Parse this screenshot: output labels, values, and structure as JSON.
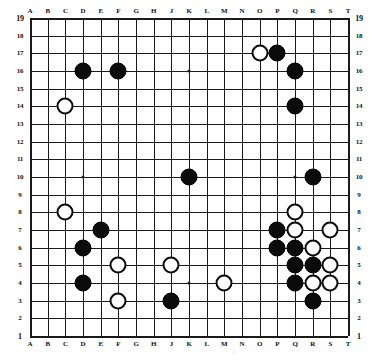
{
  "board": {
    "title": "Go board position",
    "size": 19,
    "col_labels": [
      "A",
      "B",
      "C",
      "D",
      "E",
      "F",
      "G",
      "H",
      "J",
      "K",
      "L",
      "M",
      "N",
      "O",
      "P",
      "Q",
      "R",
      "S",
      "T"
    ],
    "row_labels": [
      "19",
      "18",
      "17",
      "16",
      "15",
      "14",
      "13",
      "12",
      "11",
      "10",
      "9",
      "8",
      "7",
      "6",
      "5",
      "4",
      "3",
      "2",
      "1"
    ],
    "colors": {
      "black_stone": "#0b0b0b",
      "white_stone": "#ffffff",
      "line": "#1a1a1a",
      "background": "#ffffff"
    },
    "star_points": [
      "D16",
      "K16",
      "Q16",
      "D10",
      "K10",
      "Q10",
      "D4",
      "K4",
      "Q4"
    ],
    "black_stones": [
      "D16",
      "F16",
      "P17",
      "Q16",
      "Q14",
      "K10",
      "R10",
      "E7",
      "P7",
      "D6",
      "P6",
      "Q6",
      "Q5",
      "R5",
      "D4",
      "Q4",
      "R3",
      "J3"
    ],
    "white_stones": [
      "O17",
      "C14",
      "Q8",
      "Q7",
      "S7",
      "R6",
      "F5",
      "J5",
      "S5",
      "M4",
      "R4",
      "S4",
      "C8",
      "F3"
    ],
    "counts": {
      "black": 18,
      "white": 14
    }
  }
}
